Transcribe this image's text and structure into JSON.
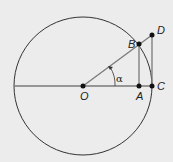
{
  "diagram": {
    "colors": {
      "background": "#ececec",
      "circle": "#333333",
      "segments": "#7a7a7a",
      "points": "#111111"
    },
    "circle": {
      "cx": 83,
      "cy": 86,
      "r": 69
    },
    "points": {
      "O": {
        "label": "O",
        "x": 83,
        "y": 86
      },
      "A": {
        "label": "A",
        "x": 139,
        "y": 86
      },
      "B": {
        "label": "B",
        "x": 139,
        "y": 44
      },
      "C": {
        "label": "C",
        "x": 152,
        "y": 86
      },
      "D": {
        "label": "D",
        "x": 152,
        "y": 35
      }
    },
    "angle_label": "α"
  }
}
